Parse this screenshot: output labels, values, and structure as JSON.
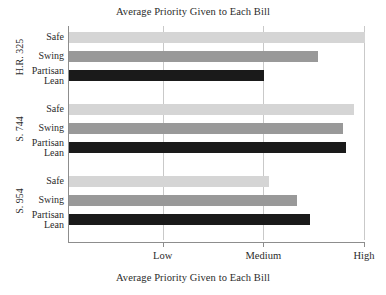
{
  "chart_data": {
    "type": "bar",
    "orientation": "horizontal",
    "title": "Average Priority Given to Each Bill",
    "xlabel": "Average Priority Given to Each Bill",
    "ylabel": "",
    "grid": true,
    "legend": "none",
    "xtick_labels": [
      "Low",
      "Medium",
      "High"
    ],
    "xtick_values": [
      1,
      2,
      3
    ],
    "xlim": [
      0.06,
      3.0
    ],
    "groups": [
      {
        "name": "H.R. 325",
        "categories": [
          "Safe",
          "Partisan\nLean",
          "Swing"
        ],
        "bars": [
          {
            "label": "Safe",
            "value": 3.0,
            "color": "#d5d5d5"
          },
          {
            "label": "Swing",
            "value": 2.53,
            "color": "#999999"
          },
          {
            "label": "Partisan\nLean",
            "value": 2.0,
            "color": "#1a1a1a"
          }
        ]
      },
      {
        "name": "S. 744",
        "categories": [
          "Safe",
          "Swing",
          "Partisan\nLean"
        ],
        "bars": [
          {
            "label": "Safe",
            "value": 2.89,
            "color": "#d5d5d5"
          },
          {
            "label": "Swing",
            "value": 2.78,
            "color": "#999999"
          },
          {
            "label": "Partisan\nLean",
            "value": 2.81,
            "color": "#1a1a1a"
          }
        ]
      },
      {
        "name": "S. 954",
        "categories": [
          "Safe",
          "Swing",
          "Partisan\nLean"
        ],
        "bars": [
          {
            "label": "Safe",
            "value": 2.05,
            "color": "#d5d5d5"
          },
          {
            "label": "Swing",
            "value": 2.32,
            "color": "#999999"
          },
          {
            "label": "Partisan\nLean",
            "value": 2.45,
            "color": "#1a1a1a"
          }
        ]
      }
    ],
    "colors": {
      "safe": "#d5d5d5",
      "swing": "#999999",
      "partisan_lean": "#1a1a1a",
      "axis": "#8d8d8d",
      "grid": "#c9c9c9",
      "text": "#2b2b2b",
      "background": "#ffffff"
    }
  },
  "labels": {
    "safe": "Safe",
    "swing": "Swing",
    "partisan_lean": "Partisan\nLean",
    "bill_1": "H.R. 325",
    "bill_2": "S. 744",
    "bill_3": "S. 954",
    "low": "Low",
    "medium": "Medium",
    "high": "High"
  }
}
